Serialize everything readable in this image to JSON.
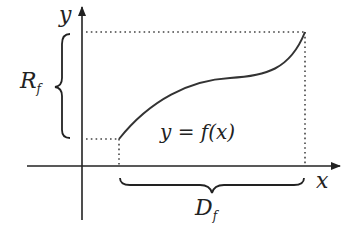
{
  "diagram": {
    "axis_x_label": "x",
    "axis_y_label": "y",
    "range_label": "R",
    "range_subscript": "f",
    "domain_label": "D",
    "domain_subscript": "f",
    "function_label": "y = f(x)",
    "colors": {
      "ink": "#222222",
      "dotted": "#444444"
    }
  }
}
